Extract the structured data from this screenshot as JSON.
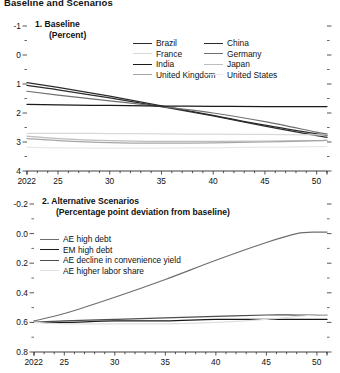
{
  "figure": {
    "title": "Baseline and Scenarios",
    "width": 340,
    "height": 373
  },
  "panels": [
    {
      "id": "baseline",
      "title": "1. Baseline",
      "subtitle": "(Percent)",
      "legend": [
        {
          "label": "Brazil",
          "color": "#2b2b2b"
        },
        {
          "label": "China",
          "color": "#2b2b2b"
        },
        {
          "label": "France",
          "color": "#d9d9d9"
        },
        {
          "label": "Germany",
          "color": "#707070"
        },
        {
          "label": "India",
          "color": "#1a1a1a"
        },
        {
          "label": "Japan",
          "color": "#bdbdbd"
        },
        {
          "label": "United Kingdom",
          "color": "#a6a6a6"
        },
        {
          "label": "United States",
          "color": "#e8e8e8"
        }
      ],
      "y_ticks": [
        "4",
        "3",
        "2",
        "1",
        "0",
        "-1"
      ],
      "x_ticks": [
        "2022",
        "25",
        "30",
        "35",
        "40",
        "45",
        "50"
      ]
    },
    {
      "id": "alternative-scenarios",
      "title": "2. Alternative Scenarios",
      "subtitle": "(Percentage point deviation from baseline)",
      "legend": [
        {
          "label": "AE high debt",
          "color": "#6e6e6e"
        },
        {
          "label": "EM high debt",
          "color": "#1a1a1a"
        },
        {
          "label": "AE decline in convenience yield",
          "color": "#4d4d4d"
        },
        {
          "label": "AE higher labor share",
          "color": "#e0e0e0"
        }
      ],
      "y_ticks": [
        "0.8",
        "0.6",
        "0.4",
        "0.2",
        "0.0",
        "-0.2"
      ],
      "x_ticks": [
        "2022",
        "25",
        "30",
        "35",
        "40",
        "45",
        "50"
      ]
    }
  ],
  "chart_data": [
    {
      "type": "line",
      "title": "1. Baseline",
      "subtitle": "(Percent)",
      "xlabel": "",
      "ylabel": "Percent",
      "xlim": [
        2022,
        2051
      ],
      "ylim": [
        -1,
        4
      ],
      "y_ticks": [
        -1,
        0,
        1,
        2,
        3,
        4
      ],
      "x_ticks": [
        2022,
        2025,
        2030,
        2035,
        2040,
        2045,
        2050
      ],
      "grid": false,
      "legend_position": "top-right",
      "x": [
        2022,
        2025,
        2030,
        2035,
        2040,
        2045,
        2050,
        2051
      ],
      "series": [
        {
          "name": "Brazil",
          "color": "#2b2b2b",
          "values": [
            2.05,
            1.88,
            1.58,
            1.25,
            0.92,
            0.58,
            0.28,
            0.22
          ]
        },
        {
          "name": "China",
          "color": "#2b2b2b",
          "values": [
            1.95,
            1.8,
            1.52,
            1.22,
            0.9,
            0.55,
            0.22,
            0.16
          ]
        },
        {
          "name": "France",
          "color": "#d9d9d9",
          "values": [
            0.3,
            0.3,
            0.29,
            0.28,
            0.27,
            0.26,
            0.25,
            0.25
          ]
        },
        {
          "name": "Germany",
          "color": "#707070",
          "values": [
            1.75,
            1.62,
            1.42,
            1.22,
            1.0,
            0.7,
            0.34,
            0.28
          ]
        },
        {
          "name": "India",
          "color": "#1a1a1a",
          "values": [
            1.3,
            1.28,
            1.26,
            1.24,
            1.23,
            1.22,
            1.22,
            1.22
          ]
        },
        {
          "name": "Japan",
          "color": "#bdbdbd",
          "values": [
            0.2,
            0.12,
            0.05,
            0.02,
            0.02,
            0.03,
            0.05,
            0.06
          ]
        },
        {
          "name": "United Kingdom",
          "color": "#a6a6a6",
          "values": [
            0.12,
            0.05,
            -0.02,
            -0.04,
            -0.03,
            0.0,
            0.05,
            0.06
          ]
        },
        {
          "name": "United States",
          "color": "#e8e8e8",
          "values": [
            -0.18,
            -0.2,
            -0.21,
            -0.21,
            -0.2,
            -0.18,
            -0.16,
            -0.15
          ]
        }
      ]
    },
    {
      "type": "line",
      "title": "2. Alternative Scenarios",
      "subtitle": "(Percentage point deviation from baseline)",
      "xlabel": "",
      "ylabel": "Percentage point deviation from baseline",
      "xlim": [
        2022,
        2051
      ],
      "ylim": [
        -0.2,
        0.8
      ],
      "y_ticks": [
        -0.2,
        0.0,
        0.2,
        0.4,
        0.6,
        0.8
      ],
      "x_ticks": [
        2022,
        2025,
        2030,
        2035,
        2040,
        2045,
        2050
      ],
      "grid": false,
      "legend_position": "top-left",
      "x": [
        2022,
        2025,
        2030,
        2035,
        2040,
        2045,
        2048,
        2050,
        2051
      ],
      "series": [
        {
          "name": "AE high debt",
          "color": "#6e6e6e",
          "values": [
            0.01,
            0.06,
            0.17,
            0.29,
            0.42,
            0.54,
            0.6,
            0.61,
            0.61
          ]
        },
        {
          "name": "EM high debt",
          "color": "#1a1a1a",
          "values": [
            0.0,
            0.0,
            0.01,
            0.01,
            0.02,
            0.02,
            0.02,
            0.02,
            0.02
          ]
        },
        {
          "name": "AE decline in convenience yield",
          "color": "#4d4d4d",
          "values": [
            0.0,
            0.01,
            0.02,
            0.03,
            0.04,
            0.05,
            0.05,
            0.05,
            0.05
          ]
        },
        {
          "name": "AE higher labor share",
          "color": "#e0e0e0",
          "values": [
            0.0,
            -0.01,
            -0.01,
            -0.01,
            0.0,
            0.02,
            0.04,
            0.05,
            0.05
          ]
        }
      ]
    }
  ]
}
